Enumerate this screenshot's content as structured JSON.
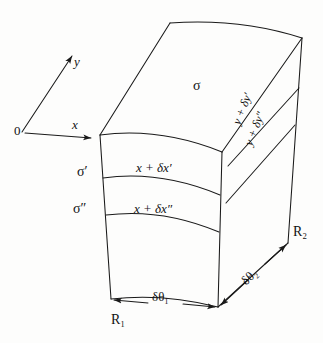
{
  "figure": {
    "stroke_color": "#1a1a1a",
    "background_color": "#fdfdfc"
  },
  "axes": {
    "origin_label": "0",
    "y_label": "y",
    "x_label": "x"
  },
  "surfaces": {
    "sigma": "σ",
    "sigma_prime": "σ′",
    "sigma_double_prime": "σ″"
  },
  "x_coordinates": {
    "first": "x + δx′",
    "second": "x + δx″"
  },
  "y_coordinates": {
    "first": "y + δy′",
    "second": "y + δy″"
  },
  "angles": {
    "delta_theta_1": "δθ₁",
    "delta_theta_2": "δθ₂"
  },
  "radii": {
    "r1": "R₁",
    "r2": "R₂"
  }
}
